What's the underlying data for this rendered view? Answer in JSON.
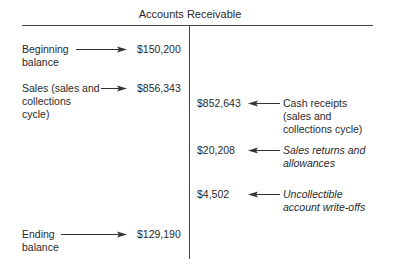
{
  "title": "Accounts Receivable",
  "debits": [
    {
      "label_lines": [
        "Beginning",
        "balance"
      ],
      "amount": "$150,200",
      "italic": false
    },
    {
      "label_lines": [
        "Sales (sales and",
        "collections",
        "cycle)"
      ],
      "amount": "$856,343",
      "italic": false
    },
    {
      "label_lines": [
        "Ending",
        "balance"
      ],
      "amount": "$129,190",
      "italic": false
    }
  ],
  "credits": [
    {
      "amount": "$852,643",
      "label_lines": [
        "Cash receipts",
        "(sales and",
        "collections cycle)"
      ],
      "italic": false
    },
    {
      "amount": "$20,208",
      "label_lines": [
        "Sales returns and",
        "allowances"
      ],
      "italic": true
    },
    {
      "amount": "$4,502",
      "label_lines": [
        "Uncollectible",
        "account write-offs"
      ],
      "italic": true
    }
  ],
  "colors": {
    "line": "#444444",
    "text": "#2a2a2a"
  }
}
